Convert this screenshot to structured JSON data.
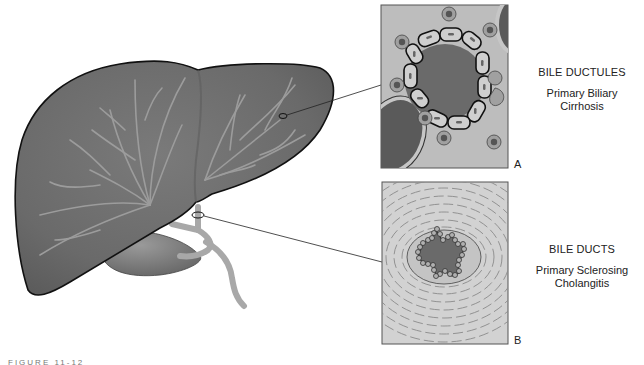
{
  "figure": {
    "caption": "FIGURE 11-12",
    "colors": {
      "liver_fill": "#6e6e6e",
      "liver_outline": "#111111",
      "vessel": "#a8a8a8",
      "panel_bg": "#bdbdbd",
      "lumen": "#6a6a6a",
      "cell_fill": "#cfcfcf",
      "nucleus": "#555555"
    }
  },
  "panels": [
    {
      "letter": "A",
      "title": "BILE DUCTULES",
      "subtitle_line1": "Primary Biliary",
      "subtitle_line2": "Cirrhosis"
    },
    {
      "letter": "B",
      "title": "BILE DUCTS",
      "subtitle_line1": "Primary Sclerosing",
      "subtitle_line2": "Cholangitis"
    }
  ]
}
